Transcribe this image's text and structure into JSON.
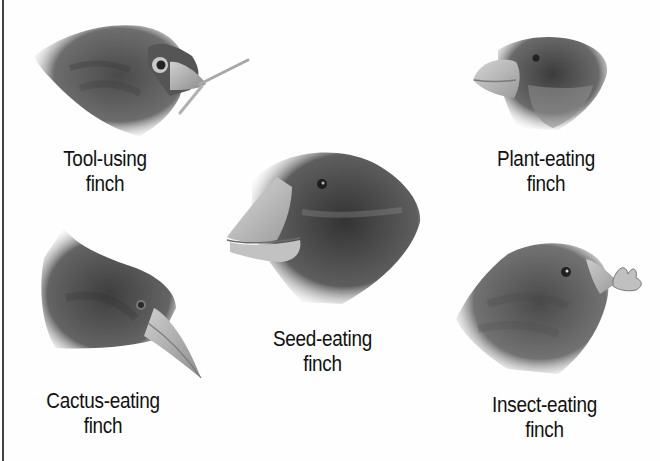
{
  "figure": {
    "finches": [
      {
        "id": "tool-using",
        "label_line1": "Tool-using",
        "label_line2": "finch",
        "beak": "pointed, holding twig"
      },
      {
        "id": "plant-eating",
        "label_line1": "Plant-eating",
        "label_line2": "finch",
        "beak": "short, thick"
      },
      {
        "id": "seed-eating",
        "label_line1": "Seed-eating",
        "label_line2": "finch",
        "beak": "large, crushing"
      },
      {
        "id": "cactus-eating",
        "label_line1": "Cactus-eating",
        "label_line2": "finch",
        "beak": "long, pointed"
      },
      {
        "id": "insect-eating",
        "label_line1": "Insect-eating",
        "label_line2": "finch",
        "beak": "thin, holding insect"
      }
    ]
  },
  "colors": {
    "background": "#fefefe",
    "text": "#111111",
    "border": "#444444",
    "feather_dark": "#3a3a3a",
    "feather_mid": "#6e6e6e",
    "beak": "#bdbdbd"
  }
}
